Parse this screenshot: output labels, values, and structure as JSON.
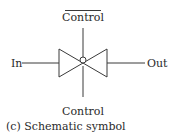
{
  "diagram": {
    "labels": {
      "control_top": "Control",
      "control_top_overbar": true,
      "control_bottom": "Control",
      "input": "In",
      "output": "Out"
    },
    "caption": "(c) Schematic symbol",
    "colors": {
      "stroke": "#3a3a3a",
      "text": "#2a2a2a",
      "background": "#ffffff"
    }
  }
}
